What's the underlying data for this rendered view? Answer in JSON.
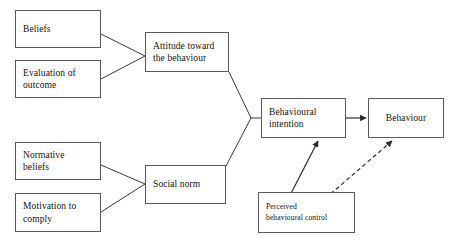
{
  "diagram": {
    "background_color": "#ffffff",
    "line_color": "#3a3a3a",
    "box_border_color": "#5a5a5a",
    "text_color": "#111111",
    "nodes": {
      "beliefs": "Beliefs",
      "evaluation_of_outcome": "Evaluation of\noutcome",
      "normative_beliefs": "Normative\nbeliefs",
      "motivation_to_comply": "Motivation to\ncomply",
      "attitude": "Attitude toward\nthe behaviour",
      "social_norm": "Social norm",
      "behavioural_intention": "Behavioural\nintention",
      "behaviour": "Behaviour",
      "perceived_behavioural_control": "Perceived\nbehavioural control"
    },
    "edges": [
      {
        "id": "beliefs-to-attitude",
        "from": "beliefs",
        "to": "attitude",
        "style": "solid",
        "arrowhead": false
      },
      {
        "id": "evaluation-to-attitude",
        "from": "evaluation_of_outcome",
        "to": "attitude",
        "style": "solid",
        "arrowhead": false
      },
      {
        "id": "normative-beliefs-to-social-norm",
        "from": "normative_beliefs",
        "to": "social_norm",
        "style": "solid",
        "arrowhead": false
      },
      {
        "id": "motivation-to-social-norm",
        "from": "motivation_to_comply",
        "to": "social_norm",
        "style": "solid",
        "arrowhead": false
      },
      {
        "id": "attitude-to-intention",
        "from": "attitude",
        "to": "behavioural_intention",
        "style": "solid",
        "arrowhead": false
      },
      {
        "id": "social-norm-to-intention",
        "from": "social_norm",
        "to": "behavioural_intention",
        "style": "solid",
        "arrowhead": false
      },
      {
        "id": "intention-to-behaviour",
        "from": "behavioural_intention",
        "to": "behaviour",
        "style": "solid",
        "arrowhead": true
      },
      {
        "id": "pbc-to-intention",
        "from": "perceived_behavioural_control",
        "to": "behavioural_intention",
        "style": "solid",
        "arrowhead": true
      },
      {
        "id": "pbc-to-behaviour",
        "from": "perceived_behavioural_control",
        "to": "behaviour",
        "style": "dashed",
        "arrowhead": true
      }
    ]
  }
}
